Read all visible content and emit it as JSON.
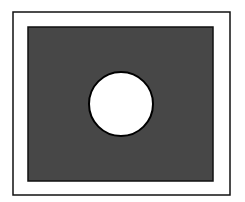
{
  "diagram": {
    "colors": {
      "background": "#ffffff",
      "frame_stroke": "#111111",
      "fill": "#474747",
      "circle_fill": "#ffffff",
      "circle_stroke": "#000000"
    },
    "outer_frame": {
      "x": 13,
      "y": 12,
      "width": 217,
      "height": 183
    },
    "inner_rect": {
      "x": 28,
      "y": 27,
      "width": 185,
      "height": 154
    },
    "circle": {
      "cx": 121,
      "cy": 104,
      "r": 32
    }
  }
}
